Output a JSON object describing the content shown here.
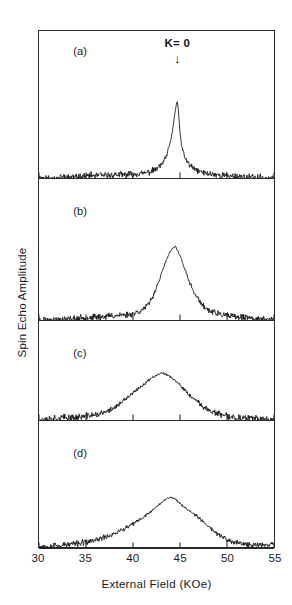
{
  "figure": {
    "ylabel": "Spin Echo Amplitude",
    "xlabel": "External Field (KOe)",
    "annotation": {
      "text": "K= 0",
      "arrow_glyph": "↓",
      "at_field": 44.7
    },
    "frame_color": "#2b2b2b",
    "trace_color": "#111111",
    "background": "#ffffff"
  },
  "chart_data": {
    "type": "line",
    "title": "",
    "subtitle": "",
    "xlabel": "External Field (KOe)",
    "ylabel": "Spin Echo Amplitude",
    "xlim": [
      30,
      55
    ],
    "ylim": [
      0,
      1
    ],
    "grid": false,
    "legend": null,
    "xticks": [
      30,
      35,
      40,
      45,
      50,
      55
    ],
    "xticklabels": [
      "30",
      "35",
      "40",
      "45",
      "50",
      "55"
    ],
    "yticks": [],
    "yticklabels": [],
    "annotations": [
      {
        "text": "K= 0",
        "x": 44.7,
        "panel": "a",
        "arrow": "down"
      },
      {
        "text": "(a)",
        "x": 34.5,
        "panel": "a"
      },
      {
        "text": "(b)",
        "x": 34.5,
        "panel": "b"
      },
      {
        "text": "(c)",
        "x": 34.5,
        "panel": "c"
      },
      {
        "text": "(d)",
        "x": 34.5,
        "panel": "d"
      }
    ],
    "panels": [
      {
        "label": "(a)",
        "peak_center": 44.7,
        "peak_height": 1.0,
        "fwhm": 0.9,
        "noise": 0.035,
        "seed": 11,
        "x": [
          30,
          30.5,
          31,
          31.5,
          32,
          32.5,
          33,
          33.5,
          34,
          34.5,
          35,
          35.5,
          36,
          36.5,
          37,
          37.5,
          38,
          38.5,
          39,
          39.5,
          40,
          40.5,
          41,
          41.5,
          42,
          42.5,
          43,
          43.5,
          44,
          44.2,
          44.4,
          44.6,
          44.7,
          44.8,
          45,
          45.2,
          45.5,
          46,
          46.5,
          47,
          47.5,
          48,
          48.5,
          49,
          49.5,
          50,
          50.5,
          51,
          51.5,
          52,
          52.5,
          53,
          53.5,
          54,
          54.5,
          55
        ],
        "y": [
          0.01,
          0.02,
          0.01,
          0.02,
          0.01,
          0.03,
          0.02,
          0.03,
          0.02,
          0.04,
          0.03,
          0.05,
          0.04,
          0.05,
          0.04,
          0.05,
          0.05,
          0.06,
          0.05,
          0.06,
          0.06,
          0.07,
          0.07,
          0.08,
          0.1,
          0.13,
          0.18,
          0.27,
          0.48,
          0.62,
          0.8,
          0.95,
          1.0,
          0.92,
          0.6,
          0.4,
          0.28,
          0.18,
          0.13,
          0.1,
          0.08,
          0.07,
          0.06,
          0.05,
          0.05,
          0.04,
          0.04,
          0.03,
          0.03,
          0.02,
          0.02,
          0.02,
          0.02,
          0.01,
          0.01,
          0.01
        ]
      },
      {
        "label": "(b)",
        "peak_center": 44.5,
        "peak_height": 1.0,
        "fwhm": 2.6,
        "noise": 0.035,
        "seed": 23,
        "x": [
          30,
          30.5,
          31,
          31.5,
          32,
          32.5,
          33,
          33.5,
          34,
          34.5,
          35,
          35.5,
          36,
          36.5,
          37,
          37.5,
          38,
          38.5,
          39,
          39.5,
          40,
          40.5,
          41,
          41.5,
          42,
          42.5,
          43,
          43.5,
          44,
          44.5,
          45,
          45.5,
          46,
          46.5,
          47,
          47.5,
          48,
          48.5,
          49,
          49.5,
          50,
          50.5,
          51,
          51.5,
          52,
          52.5,
          53,
          53.5,
          54,
          54.5,
          55
        ],
        "y": [
          0.01,
          0.02,
          0.01,
          0.02,
          0.02,
          0.03,
          0.02,
          0.03,
          0.03,
          0.04,
          0.04,
          0.05,
          0.05,
          0.06,
          0.06,
          0.07,
          0.07,
          0.08,
          0.08,
          0.09,
          0.1,
          0.12,
          0.15,
          0.2,
          0.3,
          0.45,
          0.62,
          0.8,
          0.94,
          1.0,
          0.88,
          0.7,
          0.52,
          0.38,
          0.28,
          0.2,
          0.15,
          0.12,
          0.1,
          0.08,
          0.07,
          0.06,
          0.05,
          0.05,
          0.04,
          0.04,
          0.03,
          0.03,
          0.02,
          0.02,
          0.02
        ]
      },
      {
        "label": "(c)",
        "peak_center": 43.6,
        "peak_height": 1.0,
        "fwhm": 5.0,
        "noise": 0.06,
        "seed": 37,
        "x": [
          30,
          30.5,
          31,
          31.5,
          32,
          32.5,
          33,
          33.5,
          34,
          34.5,
          35,
          35.5,
          36,
          36.5,
          37,
          37.5,
          38,
          38.5,
          39,
          39.5,
          40,
          40.5,
          41,
          41.5,
          42,
          42.5,
          43,
          43.5,
          44,
          44.5,
          45,
          45.5,
          46,
          46.5,
          47,
          47.5,
          48,
          48.5,
          49,
          49.5,
          50,
          50.5,
          51,
          51.5,
          52,
          52.5,
          53,
          53.5,
          54,
          54.5,
          55
        ],
        "y": [
          0.03,
          0.05,
          0.04,
          0.06,
          0.05,
          0.07,
          0.06,
          0.08,
          0.07,
          0.09,
          0.1,
          0.12,
          0.13,
          0.15,
          0.18,
          0.22,
          0.28,
          0.34,
          0.42,
          0.5,
          0.58,
          0.66,
          0.74,
          0.82,
          0.9,
          0.96,
          1.0,
          0.98,
          0.92,
          0.84,
          0.74,
          0.64,
          0.54,
          0.45,
          0.37,
          0.3,
          0.24,
          0.19,
          0.15,
          0.12,
          0.1,
          0.08,
          0.07,
          0.06,
          0.05,
          0.05,
          0.04,
          0.04,
          0.03,
          0.03,
          0.03
        ]
      },
      {
        "label": "(d)",
        "peak_center": 44.0,
        "peak_height": 1.0,
        "fwhm": 7.5,
        "noise": 0.05,
        "seed": 53,
        "x": [
          30,
          30.5,
          31,
          31.5,
          32,
          32.5,
          33,
          33.5,
          34,
          34.5,
          35,
          35.5,
          36,
          36.5,
          37,
          37.5,
          38,
          38.5,
          39,
          39.5,
          40,
          40.5,
          41,
          41.5,
          42,
          42.5,
          43,
          43.5,
          44,
          44.5,
          45,
          45.5,
          46,
          46.5,
          47,
          47.5,
          48,
          48.5,
          49,
          49.5,
          50,
          50.5,
          51,
          51.5,
          52,
          52.5,
          53,
          53.5,
          54,
          54.5,
          55
        ],
        "y": [
          0.04,
          0.06,
          0.05,
          0.07,
          0.06,
          0.08,
          0.08,
          0.1,
          0.1,
          0.12,
          0.13,
          0.15,
          0.17,
          0.2,
          0.23,
          0.26,
          0.3,
          0.34,
          0.38,
          0.43,
          0.48,
          0.54,
          0.6,
          0.67,
          0.74,
          0.82,
          0.9,
          0.96,
          1.0,
          0.97,
          0.88,
          0.8,
          0.74,
          0.68,
          0.6,
          0.52,
          0.44,
          0.36,
          0.29,
          0.23,
          0.18,
          0.14,
          0.12,
          0.1,
          0.09,
          0.08,
          0.08,
          0.08,
          0.09,
          0.1,
          0.12
        ]
      }
    ]
  }
}
